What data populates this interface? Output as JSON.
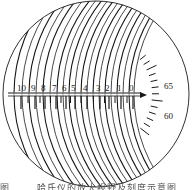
{
  "figure": {
    "colors": {
      "line": "#1a1a1a",
      "background": "#ffffff"
    }
  },
  "field_of_view": {
    "cx": 96,
    "cy": 94,
    "r": 93
  },
  "linear_scale": {
    "labels": [
      "10",
      "9",
      "8",
      "7",
      "6",
      "5",
      "4",
      "3",
      "2",
      "1",
      "0"
    ],
    "label_x": [
      17,
      31,
      41,
      52,
      62,
      71,
      83,
      96,
      105,
      117,
      129
    ],
    "axis_y": 95,
    "axis_x_start": 8,
    "arrow_end_x": 147,
    "arrow_icon": "arrow-right-icon"
  },
  "angular_scale": {
    "labels": [
      {
        "text": "65",
        "x": 164,
        "y": 89
      },
      {
        "text": "60",
        "x": 164,
        "y": 119
      }
    ]
  },
  "caption": {
    "text": "图 ……  哈氏仪的放大视野及刻度示意图"
  }
}
